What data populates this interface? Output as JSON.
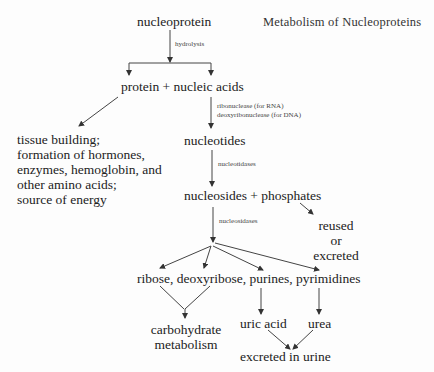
{
  "title": "Metabolism of Nucleoproteins",
  "nodes": {
    "nucleoprotein": "nucleoprotein",
    "protein_nucleic": "protein + nucleic acids",
    "protein_fate": "tissue building;\nformation of hormones,\nenzymes, hemoglobin, and\nother amino acids;\nsource of energy",
    "nucleotides": "nucleotides",
    "nucleosides_phosphates": "nucleosides + phosphates",
    "reused": "reused\nor\nexcreted",
    "products": "ribose, deoxyribose, purines, pyrimidines",
    "carbohydrate": "carbohydrate\nmetabolism",
    "uric_acid": "uric acid",
    "urea": "urea",
    "excreted_urine": "excreted in urine"
  },
  "edge_labels": {
    "hydrolysis": "hydrolysis",
    "ribonuclease": "ribonuclease (for RNA)",
    "deoxyribonuclease": "deoxyribonuclease (for DNA)",
    "nucleotidases": "nucleotidases",
    "nucleosidases": "nucleosidases"
  }
}
